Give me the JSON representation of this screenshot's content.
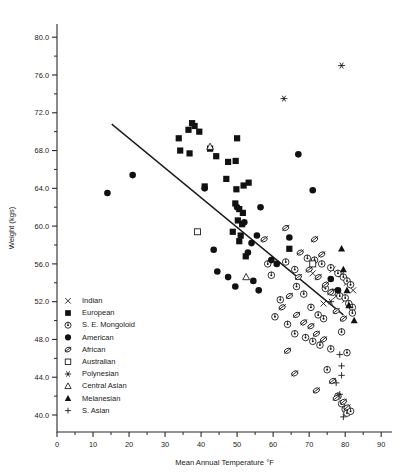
{
  "chart_data": {
    "type": "scatter",
    "title": "",
    "xlabel": "Mean Annual Temperature °F",
    "ylabel": "Weight (kgs)",
    "xlim": [
      0,
      93
    ],
    "ylim": [
      38.2,
      81.4
    ],
    "xticks": [
      0,
      10,
      20,
      30,
      40,
      50,
      60,
      70,
      80,
      90
    ],
    "xticklabels": [
      "0",
      "10",
      "20",
      "30",
      "40",
      "50",
      "60",
      "70",
      "80",
      "90"
    ],
    "yticks": [
      40.0,
      44.0,
      48.0,
      52.0,
      56.0,
      60.0,
      64.0,
      68.0,
      72.0,
      76.0,
      80.0
    ],
    "yticklabels": [
      "40.0",
      "44.0",
      "48.0",
      "52.0",
      "56.0",
      "60.0",
      "64.0",
      "68.0",
      "72.0",
      "76.0",
      "80.0"
    ],
    "xminor_step": 5,
    "yminor_step": 2,
    "grid": false,
    "legend_position": "inside-left",
    "trendline": {
      "x": [
        15.2,
        79.5
      ],
      "y": [
        70.8,
        50.6
      ],
      "label": ""
    },
    "series": [
      {
        "name": "Indian",
        "marker": "x",
        "points": [
          [
            76.5,
            55.4
          ],
          [
            79.0,
            54.9
          ],
          [
            80.5,
            54.0
          ],
          [
            82.2,
            53.2
          ],
          [
            77.5,
            52.6
          ],
          [
            80.0,
            52.2
          ],
          [
            71.0,
            55.0
          ],
          [
            74.0,
            51.8
          ]
        ]
      },
      {
        "name": "European",
        "marker": "filled-square",
        "points": [
          [
            36.5,
            70.2
          ],
          [
            38.2,
            70.6
          ],
          [
            39.5,
            70.0
          ],
          [
            33.8,
            69.3
          ],
          [
            34.2,
            68.0
          ],
          [
            36.8,
            67.7
          ],
          [
            37.5,
            70.9
          ],
          [
            50.0,
            69.3
          ],
          [
            47.5,
            66.8
          ],
          [
            49.6,
            66.9
          ],
          [
            51.8,
            64.3
          ],
          [
            49.8,
            63.9
          ],
          [
            49.5,
            62.4
          ],
          [
            50.6,
            61.8
          ],
          [
            51.6,
            61.4
          ],
          [
            50.2,
            60.6
          ],
          [
            51.4,
            60.2
          ],
          [
            48.8,
            59.4
          ],
          [
            50.6,
            58.4
          ],
          [
            64.5,
            57.6
          ],
          [
            52.4,
            56.8
          ],
          [
            42.5,
            68.2
          ],
          [
            44.2,
            67.4
          ],
          [
            47.0,
            65.0
          ],
          [
            53.2,
            64.6
          ],
          [
            41.0,
            64.2
          ],
          [
            51.0,
            59.0
          ]
        ]
      },
      {
        "name": "S. E. Mongoloid",
        "marker": "circle-dot",
        "points": [
          [
            63.5,
            56.2
          ],
          [
            66.0,
            55.4
          ],
          [
            69.5,
            56.6
          ],
          [
            71.5,
            56.4
          ],
          [
            73.5,
            56.0
          ],
          [
            76.0,
            55.6
          ],
          [
            78.0,
            55.0
          ],
          [
            79.5,
            54.6
          ],
          [
            80.5,
            54.2
          ],
          [
            81.5,
            53.8
          ],
          [
            74.5,
            53.4
          ],
          [
            76.5,
            53.0
          ],
          [
            78.5,
            52.6
          ],
          [
            80.0,
            52.4
          ],
          [
            81.0,
            51.8
          ],
          [
            82.0,
            51.4
          ],
          [
            66.5,
            53.6
          ],
          [
            68.5,
            52.8
          ],
          [
            70.5,
            51.4
          ],
          [
            72.5,
            50.6
          ],
          [
            74.0,
            50.2
          ],
          [
            62.0,
            52.2
          ],
          [
            60.5,
            50.4
          ],
          [
            64.0,
            49.6
          ],
          [
            66.0,
            48.6
          ],
          [
            69.0,
            48.2
          ],
          [
            71.0,
            47.8
          ],
          [
            73.0,
            47.4
          ],
          [
            76.0,
            47.0
          ],
          [
            79.0,
            48.8
          ],
          [
            80.5,
            46.6
          ],
          [
            82.0,
            50.8
          ],
          [
            75.0,
            44.8
          ],
          [
            78.0,
            42.0
          ],
          [
            79.0,
            41.2
          ],
          [
            80.0,
            40.6
          ],
          [
            80.5,
            40.2
          ],
          [
            81.5,
            40.4
          ],
          [
            58.5,
            56.0
          ],
          [
            59.5,
            54.8
          ]
        ]
      },
      {
        "name": "American",
        "marker": "filled-circle",
        "points": [
          [
            14.0,
            63.5
          ],
          [
            21.0,
            65.4
          ],
          [
            50.0,
            62.0
          ],
          [
            41.0,
            64.0
          ],
          [
            43.5,
            57.5
          ],
          [
            44.5,
            55.2
          ],
          [
            56.5,
            62.0
          ],
          [
            67.0,
            67.6
          ],
          [
            71.0,
            63.8
          ],
          [
            55.5,
            59.0
          ],
          [
            54.0,
            58.2
          ],
          [
            64.5,
            58.8
          ],
          [
            59.5,
            56.4
          ],
          [
            61.0,
            56.0
          ],
          [
            47.5,
            54.6
          ],
          [
            49.5,
            53.6
          ],
          [
            54.5,
            54.2
          ],
          [
            56.0,
            53.2
          ],
          [
            76.0,
            54.4
          ],
          [
            78.0,
            53.2
          ],
          [
            52.0,
            60.4
          ],
          [
            53.0,
            57.2
          ]
        ]
      },
      {
        "name": "African",
        "marker": "african",
        "points": [
          [
            63.5,
            59.8
          ],
          [
            67.5,
            57.2
          ],
          [
            71.5,
            58.6
          ],
          [
            73.5,
            57.0
          ],
          [
            70.0,
            55.4
          ],
          [
            72.5,
            54.6
          ],
          [
            67.0,
            54.6
          ],
          [
            74.5,
            53.8
          ],
          [
            76.0,
            53.0
          ],
          [
            64.5,
            52.6
          ],
          [
            62.5,
            51.4
          ],
          [
            66.5,
            50.6
          ],
          [
            68.5,
            49.8
          ],
          [
            70.5,
            49.4
          ],
          [
            72.0,
            48.6
          ],
          [
            74.0,
            48.0
          ],
          [
            77.5,
            51.0
          ],
          [
            79.5,
            50.2
          ],
          [
            64.0,
            46.8
          ],
          [
            66.0,
            44.4
          ],
          [
            76.5,
            43.6
          ],
          [
            77.5,
            41.8
          ],
          [
            79.5,
            41.4
          ],
          [
            80.5,
            40.8
          ],
          [
            72.0,
            42.6
          ],
          [
            57.5,
            58.6
          ]
        ]
      },
      {
        "name": "Australian",
        "marker": "open-square",
        "points": [
          [
            71.0,
            56.0
          ],
          [
            39.0,
            59.4
          ]
        ]
      },
      {
        "name": "Polynesian",
        "marker": "asterisk",
        "points": [
          [
            79.0,
            77.0
          ],
          [
            63.0,
            73.5
          ],
          [
            76.0,
            52.0
          ]
        ]
      },
      {
        "name": "Central Asian",
        "marker": "open-triangle",
        "points": [
          [
            42.5,
            68.4
          ],
          [
            52.5,
            54.6
          ]
        ]
      },
      {
        "name": "Melanesian",
        "marker": "filled-triangle",
        "points": [
          [
            79.0,
            57.6
          ],
          [
            79.5,
            55.4
          ],
          [
            80.5,
            53.2
          ],
          [
            81.0,
            51.6
          ],
          [
            82.5,
            50.0
          ]
        ]
      },
      {
        "name": "S. Asian",
        "marker": "plus",
        "points": [
          [
            78.5,
            46.4
          ],
          [
            79.0,
            45.2
          ],
          [
            79.0,
            44.2
          ],
          [
            77.5,
            43.4
          ],
          [
            78.5,
            42.2
          ],
          [
            79.5,
            39.8
          ]
        ]
      }
    ]
  },
  "legend": {
    "entries": [
      {
        "label": "Indian",
        "marker": "x"
      },
      {
        "label": "European",
        "marker": "filled-square"
      },
      {
        "label": "S. E. Mongoloid",
        "marker": "circle-dot"
      },
      {
        "label": "American",
        "marker": "filled-circle"
      },
      {
        "label": "African",
        "marker": "african"
      },
      {
        "label": "Australian",
        "marker": "open-square"
      },
      {
        "label": "Polynesian",
        "marker": "asterisk"
      },
      {
        "label": "Central Asian",
        "marker": "open-triangle"
      },
      {
        "label": "Melanesian",
        "marker": "filled-triangle"
      },
      {
        "label": "S. Asian",
        "marker": "plus"
      }
    ]
  },
  "colors": {
    "ink": "#111111",
    "axis": "#2a2a2a",
    "background": "#ffffff"
  }
}
